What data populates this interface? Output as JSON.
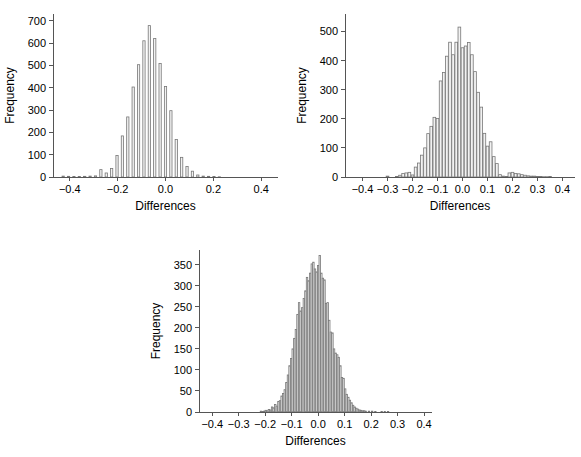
{
  "figure": {
    "background": "#ffffff",
    "bar_fill": "#f2f2f2",
    "bar_stroke": "#777777",
    "axis_color": "#555555",
    "panel_count": 3
  },
  "chart_data": [
    {
      "id": "panel-1",
      "type": "bar",
      "title": "",
      "subtitle": "",
      "xlabel": "Differences",
      "ylabel": "Frequency",
      "xlim": [
        -0.47,
        0.47
      ],
      "ylim": [
        0,
        730
      ],
      "xticks": [
        -0.4,
        -0.2,
        0.0,
        0.2,
        0.4
      ],
      "xtick_labels": [
        "−0.4",
        "−0.2",
        "0.0",
        "0.2",
        "0.4"
      ],
      "yticks": [
        0,
        100,
        200,
        300,
        400,
        500,
        600,
        700
      ],
      "ytick_labels": [
        "0",
        "100",
        "200",
        "300",
        "400",
        "500",
        "600",
        "700"
      ],
      "grid": false,
      "legend": null,
      "bin_width": 0.0225,
      "bar_relative_width": 0.42,
      "x": [
        -0.4275,
        -0.405,
        -0.3825,
        -0.36,
        -0.3375,
        -0.315,
        -0.2925,
        -0.27,
        -0.2475,
        -0.225,
        -0.2025,
        -0.18,
        -0.1575,
        -0.135,
        -0.1125,
        -0.09,
        -0.0675,
        -0.045,
        -0.0225,
        0.0,
        0.0225,
        0.045,
        0.0675,
        0.09,
        0.1125,
        0.135,
        0.1575,
        0.18,
        0.2025,
        0.225,
        0.2475,
        0.27,
        0.2925,
        0.315,
        0.3375,
        0.36,
        0.3825,
        0.405,
        0.4275
      ],
      "values": [
        4,
        3,
        2,
        2,
        3,
        4,
        5,
        33,
        18,
        38,
        96,
        184,
        269,
        403,
        503,
        610,
        678,
        620,
        508,
        405,
        297,
        168,
        88,
        47,
        26,
        9,
        4,
        3,
        2,
        1,
        0,
        0,
        0,
        0,
        0,
        0,
        0,
        0,
        0
      ],
      "values_ordered_note": "values align with x array left-to-right"
    },
    {
      "id": "panel-2",
      "type": "bar",
      "title": "",
      "subtitle": "",
      "xlabel": "Differences",
      "ylabel": "Frequency",
      "xlim": [
        -0.47,
        0.45
      ],
      "ylim": [
        0,
        560
      ],
      "xticks": [
        -0.4,
        -0.3,
        -0.2,
        -0.1,
        0.0,
        0.1,
        0.2,
        0.3,
        0.4
      ],
      "xtick_labels": [
        "−0.4",
        "−0.3",
        "−0.2",
        "−0.1",
        "0.0",
        "0.1",
        "0.2",
        "0.3",
        "0.4"
      ],
      "yticks": [
        0,
        100,
        200,
        300,
        400,
        500
      ],
      "ytick_labels": [
        "0",
        "100",
        "200",
        "300",
        "400",
        "500"
      ],
      "grid": false,
      "legend": null,
      "bin_width": 0.0125,
      "bar_relative_width": 0.86,
      "x": [
        -0.3,
        -0.2625,
        -0.25,
        -0.2375,
        -0.225,
        -0.2125,
        -0.2,
        -0.1875,
        -0.175,
        -0.1625,
        -0.15,
        -0.1375,
        -0.125,
        -0.1125,
        -0.1,
        -0.0875,
        -0.075,
        -0.0625,
        -0.05,
        -0.0375,
        -0.025,
        -0.0125,
        0.0,
        0.0125,
        0.025,
        0.0375,
        0.05,
        0.0625,
        0.075,
        0.0875,
        0.1,
        0.1125,
        0.125,
        0.1375,
        0.15,
        0.1625,
        0.175,
        0.1875,
        0.2,
        0.2125,
        0.225,
        0.2375,
        0.25,
        0.2625,
        0.275,
        0.2875,
        0.3,
        0.3125,
        0.325,
        0.3375,
        0.35
      ],
      "values": [
        3,
        2,
        6,
        12,
        14,
        16,
        7,
        34,
        48,
        75,
        100,
        149,
        174,
        205,
        201,
        330,
        359,
        415,
        463,
        420,
        463,
        515,
        444,
        450,
        462,
        420,
        362,
        291,
        240,
        150,
        106,
        121,
        70,
        46,
        8,
        3,
        2,
        14,
        16,
        12,
        11,
        8,
        6,
        4,
        3,
        3,
        2,
        2,
        1,
        1,
        2
      ]
    },
    {
      "id": "panel-3",
      "type": "bar",
      "title": "",
      "subtitle": "",
      "xlabel": "Differences",
      "ylabel": "Frequency",
      "xlim": [
        -0.45,
        0.43
      ],
      "ylim": [
        0,
        385
      ],
      "xticks": [
        -0.4,
        -0.3,
        -0.2,
        -0.1,
        0.0,
        0.1,
        0.2,
        0.3,
        0.4
      ],
      "xtick_labels": [
        "−0.4",
        "−0.3",
        "−0.2",
        "−0.1",
        "0.0",
        "0.1",
        "0.2",
        "0.3",
        "0.4"
      ],
      "yticks": [
        0,
        50,
        100,
        150,
        200,
        250,
        300,
        350
      ],
      "ytick_labels": [
        "0",
        "50",
        "100",
        "150",
        "200",
        "250",
        "300",
        "350"
      ],
      "grid": false,
      "legend": null,
      "bin_width": 0.006,
      "bar_relative_width": 0.9,
      "x": [
        -0.216,
        -0.21,
        -0.204,
        -0.198,
        -0.192,
        -0.186,
        -0.18,
        -0.174,
        -0.168,
        -0.162,
        -0.156,
        -0.15,
        -0.144,
        -0.138,
        -0.132,
        -0.126,
        -0.12,
        -0.114,
        -0.108,
        -0.102,
        -0.096,
        -0.09,
        -0.084,
        -0.078,
        -0.072,
        -0.066,
        -0.06,
        -0.054,
        -0.048,
        -0.042,
        -0.036,
        -0.03,
        -0.024,
        -0.018,
        -0.012,
        -0.006,
        0.0,
        0.006,
        0.012,
        0.018,
        0.024,
        0.03,
        0.036,
        0.042,
        0.048,
        0.054,
        0.06,
        0.066,
        0.072,
        0.078,
        0.084,
        0.09,
        0.096,
        0.102,
        0.108,
        0.114,
        0.12,
        0.126,
        0.132,
        0.138,
        0.144,
        0.15,
        0.156,
        0.162,
        0.168,
        0.174,
        0.18,
        0.192,
        0.204,
        0.216,
        0.24,
        0.252,
        0.264
      ],
      "values": [
        2,
        1,
        2,
        4,
        3,
        6,
        5,
        12,
        10,
        18,
        14,
        25,
        27,
        38,
        44,
        53,
        70,
        88,
        110,
        127,
        150,
        175,
        196,
        232,
        260,
        240,
        248,
        270,
        288,
        320,
        312,
        330,
        352,
        356,
        340,
        333,
        348,
        372,
        330,
        318,
        314,
        258,
        260,
        218,
        190,
        188,
        150,
        140,
        136,
        130,
        110,
        82,
        80,
        55,
        42,
        35,
        28,
        22,
        16,
        12,
        9,
        7,
        5,
        4,
        3,
        3,
        2,
        2,
        2,
        1,
        1,
        1,
        1
      ]
    }
  ]
}
